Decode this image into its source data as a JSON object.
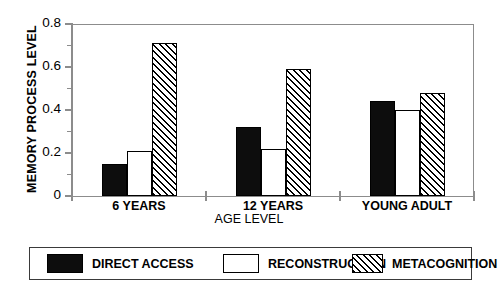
{
  "chart_data": {
    "type": "bar",
    "title": "",
    "xlabel": "AGE LEVEL",
    "ylabel": "MEMORY PROCESS LEVEL",
    "categories": [
      "6 YEARS",
      "12 YEARS",
      "YOUNG ADULT"
    ],
    "series": [
      {
        "name": "DIRECT ACCESS",
        "values": [
          0.15,
          0.32,
          0.44
        ],
        "fill": "solid-black"
      },
      {
        "name": "RECONSTRUCTION",
        "values": [
          0.21,
          0.22,
          0.4
        ],
        "fill": "white"
      },
      {
        "name": "METACOGNITION",
        "values": [
          0.71,
          0.59,
          0.48
        ],
        "fill": "diagonal-hatch"
      }
    ],
    "ylim": [
      0,
      0.8
    ],
    "ytick_labels": [
      "0",
      "0.2",
      "0.4",
      "0.6",
      "0.8"
    ],
    "ytick_values": [
      0,
      0.2,
      0.4,
      0.6,
      0.8
    ],
    "yminor_values": [
      0.1,
      0.3,
      0.5,
      0.7
    ],
    "grid": false,
    "legend_position": "bottom"
  },
  "legend": {
    "entries": [
      {
        "label": "DIRECT ACCESS"
      },
      {
        "label": "RECONSTRUCTION"
      },
      {
        "label": "METACOGNITION"
      }
    ]
  },
  "colors": {
    "axis": "#8c8c8c",
    "bar_outline": "#000000",
    "solid_fill": "#0d0d0d",
    "background": "#ffffff",
    "legend_border": "#3a3a3a"
  }
}
